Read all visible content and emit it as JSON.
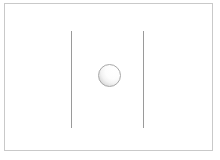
{
  "figure": {
    "canvas": {
      "width": 220,
      "height": 160,
      "background_color": "#ffffff"
    },
    "frame": {
      "name": "outer-frame",
      "x": 4,
      "y": 3,
      "width": 209,
      "height": 148,
      "stroke_color": "#c9c9c9",
      "stroke_width": 1,
      "fill_color": "#ffffff"
    },
    "lines": [
      {
        "name": "left-vertical-line",
        "x": 71,
        "y_top": 31,
        "y_bottom": 128,
        "length": 97,
        "stroke_color": "#9a9a9a",
        "stroke_width": 1
      },
      {
        "name": "right-vertical-line",
        "x": 143,
        "y_top": 31,
        "y_bottom": 128,
        "length": 97,
        "stroke_color": "#9a9a9a",
        "stroke_width": 1
      }
    ],
    "sphere": {
      "name": "shaded-sphere",
      "center_x": 109,
      "center_y": 75,
      "diameter": 23,
      "radius": 11.5,
      "stroke_color": "#a8a8a8",
      "highlight_color": "#ffffff",
      "shadow_color": "#b0b0b0",
      "light_direction": "upper-right"
    },
    "gap": {
      "name": "line-separation",
      "distance": 72
    }
  }
}
